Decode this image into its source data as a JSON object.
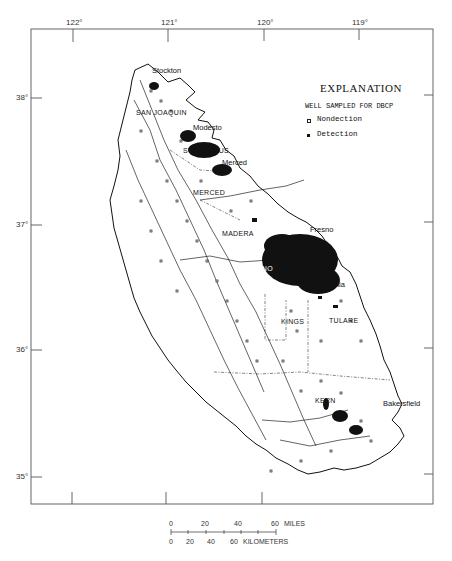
{
  "map": {
    "longitude_ticks": [
      {
        "label": "122°",
        "x": 73
      },
      {
        "label": "121°",
        "x": 168
      },
      {
        "label": "120°",
        "x": 264
      },
      {
        "label": "119°",
        "x": 359
      }
    ],
    "latitude_ticks": [
      {
        "label": "38°",
        "y": 98
      },
      {
        "label": "37°",
        "y": 225
      },
      {
        "label": "36°",
        "y": 350
      },
      {
        "label": "35°",
        "y": 477
      }
    ],
    "places": [
      {
        "name": "Stockton",
        "x": 152,
        "y": 69
      },
      {
        "name": "Modesto",
        "x": 193,
        "y": 126
      },
      {
        "name": "Merced",
        "x": 222,
        "y": 161
      },
      {
        "name": "Fresno",
        "x": 310,
        "y": 228
      },
      {
        "name": "Visalia",
        "x": 323,
        "y": 283
      },
      {
        "name": "Bakersfield",
        "x": 383,
        "y": 402
      }
    ],
    "counties": [
      {
        "name": "SAN JOAQUIN",
        "x": 136,
        "y": 112
      },
      {
        "name": "STANISLAUS",
        "x": 183,
        "y": 150
      },
      {
        "name": "MERCED",
        "x": 193,
        "y": 192
      },
      {
        "name": "MADERA",
        "x": 222,
        "y": 233
      },
      {
        "name": "FRESNO",
        "x": 242,
        "y": 268
      },
      {
        "name": "KINGS",
        "x": 281,
        "y": 321
      },
      {
        "name": "TULARE",
        "x": 329,
        "y": 320
      },
      {
        "name": "KERN",
        "x": 315,
        "y": 400
      }
    ]
  },
  "legend": {
    "title": "EXPLANATION",
    "subtitle": "WELL SAMPLED FOR DBCP",
    "items": [
      {
        "symbol": "open-square",
        "label": "Nondection"
      },
      {
        "symbol": "filled-square",
        "label": "Detection"
      }
    ]
  },
  "scale_bar": {
    "miles": {
      "ticks": [
        "0",
        "20",
        "40",
        "60"
      ],
      "unit": "MILES"
    },
    "kilometers": {
      "ticks": [
        "0",
        "20",
        "40",
        "60"
      ],
      "unit": "KILOMETERS"
    }
  },
  "colors": {
    "ink": "#111111",
    "frame": "#555555",
    "background": "#ffffff"
  }
}
